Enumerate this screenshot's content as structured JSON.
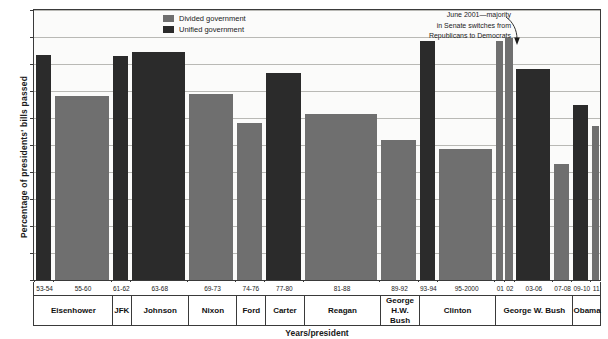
{
  "chart_data": {
    "type": "bar",
    "title": "",
    "xlabel": "Years/president",
    "ylabel": "Percentage of presidents' bills passed",
    "ylim": [
      0,
      100
    ],
    "yticks": [
      0,
      10,
      20,
      30,
      40,
      50,
      60,
      70,
      80,
      90,
      100
    ],
    "grid": true,
    "legend_position": "top-center",
    "legend": [
      {
        "name": "Divided government",
        "color": "#6f6f6f"
      },
      {
        "name": "Unified government",
        "color": "#2b2b2b"
      }
    ],
    "categories": [
      "53-54",
      "55-60",
      "61-62",
      "63-68",
      "69-73",
      "74-76",
      "77-80",
      "81-88",
      "89-92",
      "93-94",
      "95-2000",
      "01",
      "02",
      "03-06",
      "07-08",
      "09-10",
      "11"
    ],
    "values": [
      83.5,
      68,
      83,
      84.5,
      69,
      58,
      76.5,
      61.5,
      52,
      88.5,
      48.5,
      88.5,
      89.5,
      78,
      43,
      65,
      57
    ],
    "series_type": [
      "unified",
      "divided",
      "unified",
      "unified",
      "divided",
      "divided",
      "unified",
      "divided",
      "divided",
      "unified",
      "divided",
      "divided",
      "divided",
      "unified",
      "divided",
      "unified",
      "divided"
    ],
    "annotations": [
      {
        "text_lines": [
          "June 2001—majority",
          "in Senate switches from",
          "Republicans to Democrats"
        ],
        "points_to": "01"
      }
    ],
    "presidents": [
      {
        "label": "Eisenhower",
        "years": [
          "53-54",
          "55-60"
        ]
      },
      {
        "label": "JFK",
        "years": [
          "61-62"
        ]
      },
      {
        "label": "Johnson",
        "years": [
          "63-68"
        ]
      },
      {
        "label": "Nixon",
        "years": [
          "69-73"
        ]
      },
      {
        "label": "Ford",
        "years": [
          "74-76"
        ]
      },
      {
        "label": "Carter",
        "years": [
          "77-80"
        ]
      },
      {
        "label": "Reagan",
        "years": [
          "81-88"
        ]
      },
      {
        "label": "George H.W. Bush",
        "years": [
          "89-92"
        ]
      },
      {
        "label": "Clinton",
        "years": [
          "93-94",
          "95-2000"
        ]
      },
      {
        "label": "George W. Bush",
        "years": [
          "01",
          "02",
          "03-06",
          "07-08"
        ]
      },
      {
        "label": "Obama",
        "years": [
          "09-10",
          "11"
        ]
      }
    ]
  },
  "axis": {
    "y_title": "Percentage of presidents' bills passed",
    "x_title": "Years/president",
    "ylabels": [
      "100",
      "90",
      "80",
      "70",
      "60",
      "50",
      "40",
      "30",
      "20",
      "10",
      "0"
    ]
  },
  "legend": {
    "divided_label": "Divided government",
    "unified_label": "Unified government"
  },
  "annotation": {
    "line1": "June 2001—majority",
    "line2": "in Senate switches from",
    "line3": "Republicans to Democrats"
  },
  "year_labels": [
    "53-54",
    "55-60",
    "61-62",
    "63-68",
    "69-73",
    "74-76",
    "77-80",
    "81-88",
    "89-92",
    "93-94",
    "95-2000",
    "01",
    "02",
    "03-06",
    "07-08",
    "09-10",
    "11"
  ],
  "president_labels": [
    "Eisenhower",
    "JFK",
    "Johnson",
    "Nixon",
    "Ford",
    "Carter",
    "Reagan",
    "George H.W. Bush",
    "Clinton",
    "George W. Bush",
    "Obama"
  ],
  "colors": {
    "divided": "#6f6f6f",
    "unified": "#2b2b2b",
    "frame": "#3a3a3a",
    "grid": "#b9b9b5",
    "plot_bg": "#fbfbfa"
  }
}
